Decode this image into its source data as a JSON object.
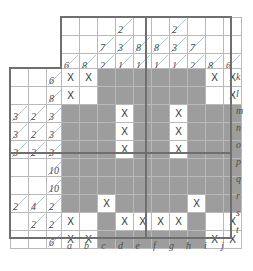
{
  "puzzle": {
    "kind": "nonogram",
    "title": "Nonogram grid",
    "grid_width": 10,
    "grid_height": 10,
    "colors": {
      "shaded": "#9d9d9d",
      "blank": "#ffffff",
      "grid_line": "#b9b9b9",
      "heavy_line": "#6f6f6f",
      "clue_text": "#4a4a4a",
      "slash": "#9fb0c4",
      "x_mark": "#333333"
    },
    "x_glyph": "X",
    "column_labels": [
      "a",
      "b",
      "c",
      "d",
      "e",
      "f",
      "g",
      "h",
      "i",
      "j"
    ],
    "row_labels": [
      "k",
      "l",
      "m",
      "n",
      "o",
      "p",
      "q",
      "r",
      "s",
      "t"
    ],
    "column_clues": [
      {
        "label": "a",
        "values": [
          "",
          "",
          "6"
        ]
      },
      {
        "label": "b",
        "values": [
          "",
          "",
          "8"
        ]
      },
      {
        "label": "c",
        "values": [
          "",
          "7",
          "2"
        ]
      },
      {
        "label": "d",
        "values": [
          "2",
          "3",
          "1"
        ]
      },
      {
        "label": "e",
        "values": [
          "",
          "8",
          "1"
        ]
      },
      {
        "label": "f",
        "values": [
          "",
          "8",
          "1"
        ]
      },
      {
        "label": "g",
        "values": [
          "2",
          "3",
          "1"
        ]
      },
      {
        "label": "h",
        "values": [
          "",
          "7",
          "2"
        ]
      },
      {
        "label": "i",
        "values": [
          "",
          "",
          "8"
        ]
      },
      {
        "label": "j",
        "values": [
          "",
          "",
          "6"
        ]
      }
    ],
    "row_clues": [
      {
        "label": "k",
        "values": [
          "",
          "",
          "6"
        ]
      },
      {
        "label": "l",
        "values": [
          "",
          "",
          "8"
        ]
      },
      {
        "label": "m",
        "values": [
          "3",
          "2",
          "3"
        ]
      },
      {
        "label": "n",
        "values": [
          "3",
          "2",
          "3"
        ]
      },
      {
        "label": "o",
        "values": [
          "3",
          "2",
          "3"
        ]
      },
      {
        "label": "p",
        "values": [
          "",
          "",
          "10"
        ]
      },
      {
        "label": "q",
        "values": [
          "",
          "",
          "10"
        ]
      },
      {
        "label": "r",
        "values": [
          "2",
          "4",
          "2"
        ]
      },
      {
        "label": "s",
        "values": [
          "",
          "2",
          "2"
        ]
      },
      {
        "label": "t",
        "values": [
          "",
          "",
          "6"
        ]
      }
    ],
    "cells": [
      {
        "row": "k",
        "states": [
          "x",
          "x",
          "shaded",
          "shaded",
          "shaded",
          "shaded",
          "shaded",
          "shaded",
          "x",
          "x"
        ]
      },
      {
        "row": "l",
        "states": [
          "x",
          "blank",
          "shaded",
          "shaded",
          "shaded",
          "shaded",
          "shaded",
          "shaded",
          "blank",
          "x"
        ]
      },
      {
        "row": "m",
        "states": [
          "shaded",
          "shaded",
          "shaded",
          "x",
          "shaded",
          "shaded",
          "x",
          "shaded",
          "shaded",
          "shaded"
        ]
      },
      {
        "row": "n",
        "states": [
          "shaded",
          "shaded",
          "shaded",
          "x",
          "shaded",
          "shaded",
          "x",
          "shaded",
          "shaded",
          "shaded"
        ]
      },
      {
        "row": "o",
        "states": [
          "shaded",
          "shaded",
          "shaded",
          "x",
          "shaded",
          "shaded",
          "x",
          "shaded",
          "shaded",
          "shaded"
        ]
      },
      {
        "row": "p",
        "states": [
          "shaded",
          "shaded",
          "shaded",
          "shaded",
          "shaded",
          "shaded",
          "shaded",
          "shaded",
          "shaded",
          "shaded"
        ]
      },
      {
        "row": "q",
        "states": [
          "shaded",
          "shaded",
          "shaded",
          "shaded",
          "shaded",
          "shaded",
          "shaded",
          "shaded",
          "shaded",
          "shaded"
        ]
      },
      {
        "row": "r",
        "states": [
          "shaded",
          "shaded",
          "x",
          "shaded",
          "shaded",
          "shaded",
          "shaded",
          "x",
          "shaded",
          "shaded"
        ]
      },
      {
        "row": "s",
        "states": [
          "x",
          "blank",
          "shaded",
          "x",
          "x",
          "x",
          "x",
          "shaded",
          "blank",
          "x"
        ]
      },
      {
        "row": "t",
        "states": [
          "x",
          "x",
          "shaded",
          "shaded",
          "shaded",
          "shaded",
          "shaded",
          "shaded",
          "x",
          "x"
        ]
      }
    ],
    "heavy_separators": {
      "vertical_after_columns": [
        5
      ],
      "horizontal_after_rows": [
        5
      ]
    }
  }
}
